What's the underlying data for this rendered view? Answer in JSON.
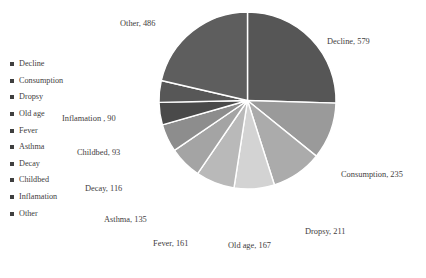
{
  "chart_data": {
    "type": "pie",
    "title": "",
    "categories": [
      "Decline",
      "Consumption",
      "Dropsy",
      "Old age",
      "Fever",
      "Asthma",
      "Decay",
      "Childbed",
      "Inflamation",
      "Other"
    ],
    "values": [
      579,
      235,
      211,
      167,
      161,
      135,
      116,
      93,
      90,
      486
    ],
    "total": 2273,
    "start_angle_deg": 0,
    "direction": "clockwise",
    "exploded": false,
    "slice_gap": true,
    "legend_position": "left",
    "grid": false,
    "colors": [
      "#565656",
      "#9a9a9a",
      "#ababab",
      "#d3d3d3",
      "#b9b9b9",
      "#a4a4a4",
      "#8d8d8d",
      "#4a4a4a",
      "#575757",
      "#5e5e5e"
    ],
    "data_labels": [
      "Decline, 579",
      "Consumption, 235",
      "Dropsy, 211",
      "Old age, 167",
      "Fever, 161",
      "Asthma, 135",
      "Decay, 116",
      "Childbed, 93",
      "Inflamation , 90",
      "Other, 486"
    ]
  },
  "legend": {
    "items": [
      {
        "label": "Decline"
      },
      {
        "label": "Consumption"
      },
      {
        "label": "Dropsy"
      },
      {
        "label": "Old age"
      },
      {
        "label": "Fever"
      },
      {
        "label": "Asthma"
      },
      {
        "label": "Decay"
      },
      {
        "label": "Childbed"
      },
      {
        "label": "Inflamation"
      },
      {
        "label": "Other"
      }
    ]
  }
}
